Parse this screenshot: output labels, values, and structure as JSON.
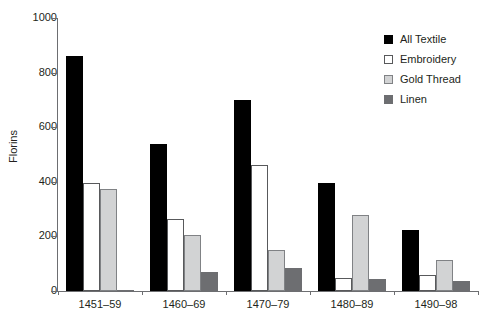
{
  "chart_data": {
    "type": "bar",
    "title": "",
    "xlabel": "",
    "ylabel": "Florins",
    "categories": [
      "1451–59",
      "1460–69",
      "1470–79",
      "1480–89",
      "1490–98"
    ],
    "series": [
      {
        "name": "All Textile",
        "color": "#000000",
        "values": [
          860,
          540,
          700,
          395,
          222
        ]
      },
      {
        "name": "Embroidery",
        "color": "#ffffff",
        "values": [
          395,
          265,
          460,
          48,
          60
        ]
      },
      {
        "name": "Gold Thread",
        "color": "#d2d3d4",
        "values": [
          375,
          207,
          150,
          280,
          115
        ]
      },
      {
        "name": "Linen",
        "color": "#6d6e71",
        "values": [
          5,
          70,
          85,
          45,
          38
        ]
      }
    ],
    "ylim": [
      0,
      1000
    ],
    "yticks": [
      0,
      200,
      400,
      600,
      800,
      1000
    ],
    "ytick_labels": [
      "0",
      "200",
      "400",
      "600",
      "800",
      "1000"
    ],
    "grid": false,
    "legend_position": "top-right"
  },
  "legend": {
    "items": [
      {
        "label": "All Textile"
      },
      {
        "label": "Embroidery"
      },
      {
        "label": "Gold Thread"
      },
      {
        "label": "Linen"
      }
    ]
  }
}
